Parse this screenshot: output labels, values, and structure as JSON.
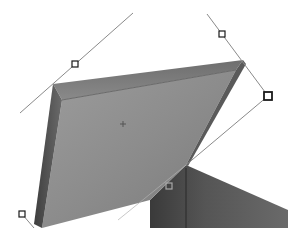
{
  "canvas": {
    "width": 306,
    "height": 240,
    "background": "#ffffff"
  },
  "image": {
    "subject": "open box with lid",
    "colors": {
      "lid_face_light": "#9a9a9a",
      "lid_face_mid": "#858585",
      "lid_edge_top": "#7c7c7c",
      "lid_edge_side": "#4e4e4e",
      "box_body": "#5a5a5a",
      "box_body_dark": "#3f3f3f"
    }
  },
  "transform_guides": {
    "line_color": "#8a8a8a",
    "handle_stroke": "#1a1a1a",
    "handle_fill": "#ffffff"
  },
  "handles": [
    {
      "name": "handle-left-edge-mid",
      "x": 75,
      "y": 64,
      "size": 6
    },
    {
      "name": "handle-right-top",
      "x": 222,
      "y": 34,
      "size": 6
    },
    {
      "name": "handle-right-corner",
      "x": 268,
      "y": 96,
      "size": 8
    },
    {
      "name": "handle-bottom-mid",
      "x": 169,
      "y": 186,
      "size": 6
    },
    {
      "name": "handle-bottom-left",
      "x": 22,
      "y": 214,
      "size": 6
    }
  ],
  "center_marker": {
    "x": 123,
    "y": 124
  }
}
